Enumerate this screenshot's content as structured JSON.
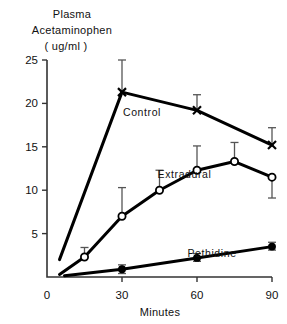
{
  "chart_data": {
    "type": "line",
    "title": "",
    "ylabel_line1": "Plasma",
    "ylabel_line2": "Acetaminophen",
    "ylabel_line3": "( ug/ml )",
    "xlabel": "Minutes",
    "xlim": [
      0,
      90
    ],
    "ylim": [
      0,
      25
    ],
    "xticks": [
      "0",
      "30",
      "60",
      "90"
    ],
    "xtick_values": [
      0,
      30,
      60,
      90
    ],
    "yticks": [
      "25",
      "20",
      "15",
      "10",
      "5"
    ],
    "ytick_values": [
      25,
      20,
      15,
      10,
      5
    ],
    "grid": false,
    "legend_position": "inline-annotations",
    "series": [
      {
        "name": "Control",
        "marker": "x-filled",
        "label_x": 38,
        "label_y": 18.6,
        "x": [
          5,
          30,
          60,
          90
        ],
        "values": [
          2.0,
          21.3,
          19.2,
          15.2
        ],
        "err_up": [
          0,
          3.7,
          1.8,
          2.0
        ],
        "err_down": [
          0,
          0,
          0,
          0
        ]
      },
      {
        "name": "Extradural",
        "marker": "open-circle",
        "label_x": 55,
        "label_y": 11.4,
        "x": [
          5,
          15,
          30,
          45,
          60,
          75,
          90
        ],
        "values": [
          0.3,
          2.3,
          7.0,
          10.0,
          12.3,
          13.3,
          11.5
        ],
        "err_up": [
          0,
          1.1,
          3.3,
          2.3,
          2.8,
          2.2,
          0
        ],
        "err_down": [
          0,
          0,
          0,
          0,
          0,
          0,
          2.4
        ]
      },
      {
        "name": "Pethidine",
        "marker": "filled-circle",
        "label_x": 66,
        "label_y": 2.3,
        "x": [
          7,
          30,
          60,
          90
        ],
        "values": [
          0.15,
          0.9,
          2.2,
          3.5
        ],
        "err_up": [
          0,
          0.5,
          0.5,
          0.5
        ],
        "err_down": [
          0,
          0.5,
          0.4,
          0.4
        ]
      }
    ],
    "colors": {
      "line": "#000000",
      "axis": "#333333",
      "errorbar": "#555555",
      "background": "#ffffff",
      "text": "#111111"
    }
  }
}
